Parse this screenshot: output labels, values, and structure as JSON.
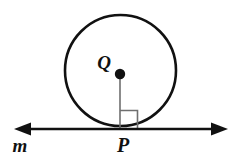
{
  "figure": {
    "kind": "geometry-diagram",
    "background_color": "#ffffff",
    "stroke_color": "#111111",
    "thin_stroke_color": "#6f6f6f",
    "labels": {
      "center": "Q",
      "tangent_point": "P",
      "line": "m"
    },
    "circle": {
      "center_x": 120.5,
      "center_y": 70.5,
      "radius": 55.5,
      "stroke_width": 2.6,
      "fill": "#ffffff"
    },
    "center_dot": {
      "cx": 120,
      "cy": 74,
      "r": 5.2
    },
    "radius_segment": {
      "x1": 120,
      "y1": 74,
      "x2": 120,
      "y2": 129,
      "stroke_width": 1.6
    },
    "right_angle_mark": {
      "x": 120,
      "y": 110,
      "size": 18,
      "opens": "right",
      "stroke_width": 1.6
    },
    "tangent_line": {
      "y": 129,
      "x_start": 14,
      "x_end": 228,
      "stroke_width": 2.6,
      "arrow_both_ends": true,
      "arrow_length": 15,
      "arrow_half_width": 6.5
    },
    "label_positions": {
      "q": {
        "x": 104,
        "y": 69
      },
      "p": {
        "x": 123,
        "y": 152
      },
      "m": {
        "x": 20,
        "y": 152
      }
    }
  }
}
